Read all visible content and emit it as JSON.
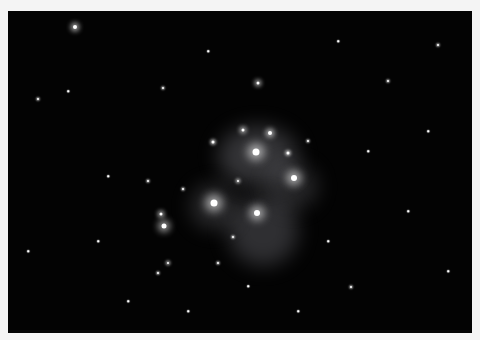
{
  "image": {
    "subject": "star cluster with reflection nebula",
    "background_color": "#030303",
    "border_color": "#f4f4f4",
    "nebulae": [
      {
        "x": 250,
        "y": 145,
        "w": 80,
        "h": 60,
        "o": 0.28
      },
      {
        "x": 255,
        "y": 220,
        "w": 70,
        "h": 70,
        "o": 0.25
      },
      {
        "x": 205,
        "y": 195,
        "w": 45,
        "h": 45,
        "o": 0.22
      },
      {
        "x": 285,
        "y": 175,
        "w": 50,
        "h": 45,
        "o": 0.2
      }
    ],
    "stars": [
      {
        "x": 248,
        "y": 141,
        "r": 7,
        "glow": 10
      },
      {
        "x": 286,
        "y": 167,
        "r": 6,
        "glow": 9
      },
      {
        "x": 206,
        "y": 192,
        "r": 7,
        "glow": 10
      },
      {
        "x": 249,
        "y": 202,
        "r": 6,
        "glow": 9
      },
      {
        "x": 262,
        "y": 122,
        "r": 4,
        "glow": 5
      },
      {
        "x": 235,
        "y": 119,
        "r": 3,
        "glow": 4
      },
      {
        "x": 156,
        "y": 215,
        "r": 5,
        "glow": 7
      },
      {
        "x": 153,
        "y": 203,
        "r": 3,
        "glow": 4
      },
      {
        "x": 67,
        "y": 16,
        "r": 4,
        "glow": 5
      },
      {
        "x": 250,
        "y": 72,
        "r": 3,
        "glow": 4
      },
      {
        "x": 205,
        "y": 131,
        "r": 3,
        "glow": 3
      },
      {
        "x": 280,
        "y": 142,
        "r": 3,
        "glow": 3
      },
      {
        "x": 230,
        "y": 170,
        "r": 2,
        "glow": 3
      },
      {
        "x": 175,
        "y": 178,
        "r": 2,
        "glow": 2
      },
      {
        "x": 140,
        "y": 170,
        "r": 2,
        "glow": 2
      },
      {
        "x": 160,
        "y": 252,
        "r": 2,
        "glow": 3
      },
      {
        "x": 150,
        "y": 262,
        "r": 2,
        "glow": 2
      },
      {
        "x": 210,
        "y": 252,
        "r": 2,
        "glow": 2
      },
      {
        "x": 225,
        "y": 226,
        "r": 2,
        "glow": 2
      },
      {
        "x": 155,
        "y": 77,
        "r": 2,
        "glow": 2
      },
      {
        "x": 30,
        "y": 88,
        "r": 2,
        "glow": 2
      },
      {
        "x": 430,
        "y": 34,
        "r": 2,
        "glow": 2
      },
      {
        "x": 343,
        "y": 276,
        "r": 2,
        "glow": 2
      },
      {
        "x": 300,
        "y": 130,
        "r": 2,
        "glow": 2
      },
      {
        "x": 380,
        "y": 70,
        "r": 2,
        "glow": 2
      },
      {
        "x": 100,
        "y": 165,
        "r": 1.5,
        "glow": 1
      },
      {
        "x": 60,
        "y": 80,
        "r": 1.5,
        "glow": 1
      },
      {
        "x": 320,
        "y": 230,
        "r": 1.5,
        "glow": 1
      },
      {
        "x": 400,
        "y": 200,
        "r": 1.5,
        "glow": 1
      },
      {
        "x": 120,
        "y": 290,
        "r": 1.5,
        "glow": 1
      },
      {
        "x": 290,
        "y": 300,
        "r": 1.5,
        "glow": 1
      },
      {
        "x": 440,
        "y": 260,
        "r": 1.5,
        "glow": 1
      },
      {
        "x": 360,
        "y": 140,
        "r": 1.5,
        "glow": 1
      },
      {
        "x": 200,
        "y": 40,
        "r": 1.5,
        "glow": 1
      },
      {
        "x": 20,
        "y": 240,
        "r": 1.5,
        "glow": 1
      },
      {
        "x": 90,
        "y": 230,
        "r": 1.5,
        "glow": 1
      },
      {
        "x": 330,
        "y": 30,
        "r": 1.5,
        "glow": 1
      },
      {
        "x": 420,
        "y": 120,
        "r": 1.5,
        "glow": 1
      },
      {
        "x": 240,
        "y": 275,
        "r": 1.5,
        "glow": 1
      },
      {
        "x": 180,
        "y": 300,
        "r": 1.5,
        "glow": 1
      }
    ]
  }
}
